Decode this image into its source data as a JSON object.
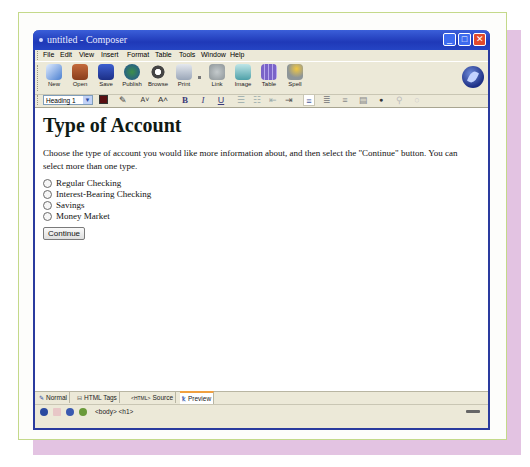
{
  "window": {
    "title": "untitled - Composer",
    "controls": {
      "minimize": "_",
      "maximize": "□",
      "close": "✕"
    }
  },
  "menubar": [
    "File",
    "Edit",
    "View",
    "Insert",
    "Format",
    "Table",
    "Tools",
    "Window",
    "Help"
  ],
  "toolbar": {
    "buttons": [
      {
        "label": "New",
        "icon": "new-document-icon",
        "color": "#4a7fd0"
      },
      {
        "label": "Open",
        "icon": "folder-icon",
        "color": "#a4502c"
      },
      {
        "label": "Save",
        "icon": "save-icon",
        "color": "#2c47a8"
      },
      {
        "label": "Publish",
        "icon": "globe-icon",
        "color": "#2f7f3c"
      },
      {
        "label": "Browse",
        "icon": "eye-icon",
        "color": "#444444"
      },
      {
        "label": "Print",
        "icon": "printer-icon",
        "color": "#9aa6b8"
      },
      {
        "label": "Link",
        "icon": "link-icon",
        "color": "#8d9598"
      },
      {
        "label": "Image",
        "icon": "image-icon",
        "color": "#4ea0a8"
      },
      {
        "label": "Table",
        "icon": "table-icon",
        "color": "#7a63c8"
      },
      {
        "label": "Spell",
        "icon": "spell-icon",
        "color": "#d6a82c"
      }
    ]
  },
  "format_toolbar": {
    "paragraph_style": "Heading 1",
    "text_color": "#5a0f12",
    "buttons": [
      {
        "name": "highlight",
        "glyph": "✎"
      },
      {
        "name": "smaller-font",
        "glyph": "A˅"
      },
      {
        "name": "larger-font",
        "glyph": "A˄"
      },
      {
        "name": "bold",
        "glyph": "B"
      },
      {
        "name": "italic",
        "glyph": "I"
      },
      {
        "name": "underline",
        "glyph": "U"
      },
      {
        "name": "bullet-list",
        "glyph": "☰"
      },
      {
        "name": "numbered-list",
        "glyph": "☷"
      },
      {
        "name": "outdent",
        "glyph": "⇤"
      },
      {
        "name": "indent",
        "glyph": "⇥"
      },
      {
        "name": "align-left",
        "glyph": "≡"
      },
      {
        "name": "align-center",
        "glyph": "≣"
      },
      {
        "name": "align-right",
        "glyph": "≡"
      },
      {
        "name": "justify",
        "glyph": "▤"
      },
      {
        "name": "anchor",
        "glyph": "●"
      },
      {
        "name": "link-tool",
        "glyph": "⚲"
      },
      {
        "name": "misc",
        "glyph": "○"
      }
    ]
  },
  "document": {
    "heading": "Type of Account",
    "instructions": "Choose the type of account you would like more information about, and then select the \"Continue\" button. You can select more than one type.",
    "options": [
      "Regular Checking",
      "Interest-Bearing Checking",
      "Savings",
      "Money Market"
    ],
    "continue_label": "Continue"
  },
  "edit_tabs": [
    {
      "label": "Normal",
      "icon": "pencil-icon",
      "glyph": "✎"
    },
    {
      "label": "HTML Tags",
      "icon": "tags-icon",
      "glyph": "⊟"
    },
    {
      "label": "Source",
      "icon": "source-icon",
      "glyph": "<HTML>"
    },
    {
      "label": "Preview",
      "icon": "preview-icon",
      "glyph": "ꝁ"
    }
  ],
  "active_tab": "Preview",
  "statusbar": {
    "path": "<body> <h1>"
  }
}
